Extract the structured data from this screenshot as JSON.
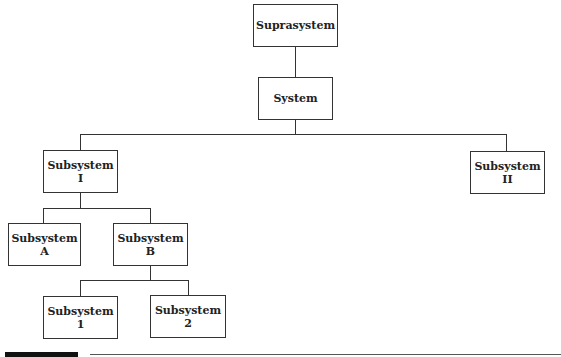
{
  "diagram": {
    "type": "hierarchy",
    "nodes": {
      "suprasystem": {
        "line1": "Suprasystem",
        "line2": ""
      },
      "system": {
        "line1": "System",
        "line2": ""
      },
      "sub_i": {
        "line1": "Subsystem",
        "line2": "I"
      },
      "sub_ii": {
        "line1": "Subsystem",
        "line2": "II"
      },
      "sub_a": {
        "line1": "Subsystem",
        "line2": "A"
      },
      "sub_b": {
        "line1": "Subsystem",
        "line2": "B"
      },
      "sub_1": {
        "line1": "Subsystem",
        "line2": "1"
      },
      "sub_2": {
        "line1": "Subsystem",
        "line2": "2"
      }
    },
    "edges": [
      [
        "Suprasystem",
        "System"
      ],
      [
        "System",
        "Subsystem I"
      ],
      [
        "System",
        "Subsystem II"
      ],
      [
        "Subsystem I",
        "Subsystem A"
      ],
      [
        "Subsystem I",
        "Subsystem B"
      ],
      [
        "Subsystem B",
        "Subsystem 1"
      ],
      [
        "Subsystem B",
        "Subsystem 2"
      ]
    ],
    "colors": {
      "line": "#333333",
      "box_bg": "#ffffff",
      "footer_bar": "#111111"
    }
  }
}
